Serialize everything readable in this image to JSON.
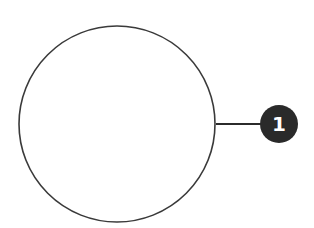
{
  "diagram": {
    "shape": {
      "type": "circle",
      "cx": 117,
      "cy": 124,
      "r": 98,
      "stroke": "#3a3a3a",
      "fill": "#ffffff"
    },
    "connector": {
      "x1": 216,
      "y1": 124,
      "x2": 262,
      "y2": 124,
      "stroke": "#2b2b2b"
    },
    "callout": {
      "label": "1",
      "cx": 279,
      "cy": 124,
      "r": 19,
      "fill": "#2a2a2a",
      "text_color": "#ffffff"
    }
  }
}
